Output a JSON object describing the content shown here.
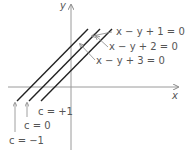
{
  "axes": {
    "x_label": "x",
    "y_label": "y"
  },
  "lines": [
    {
      "equation": "x − y + 1 = 0",
      "c_label": "c = +1"
    },
    {
      "equation": "x − y + 2 = 0",
      "c_label": "c = 0"
    },
    {
      "equation": "x − y + 3 = 0",
      "c_label": "c = −1"
    }
  ],
  "colors": {
    "line": "#222222",
    "axis": "#9a9a9a",
    "text": "#555555"
  }
}
